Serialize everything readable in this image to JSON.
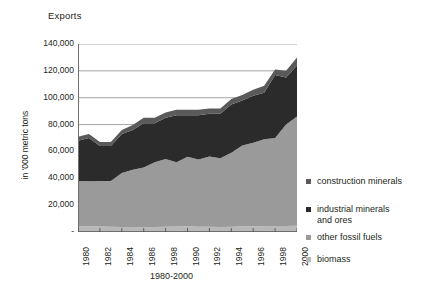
{
  "chart_data": {
    "type": "area",
    "stacked": true,
    "title": "Exports",
    "xlabel": "1980-2000",
    "ylabel": "in '000 metric tons",
    "ylim": [
      0,
      140000
    ],
    "grid": true,
    "legend_position": "right",
    "y_ticks": [
      "-",
      "20,000",
      "40,000",
      "60,000",
      "80,000",
      "100,000",
      "120,000",
      "140,000"
    ],
    "y_tick_values": [
      0,
      20000,
      40000,
      60000,
      80000,
      100000,
      120000,
      140000
    ],
    "x_tick_labels": [
      "1980",
      "1982",
      "1984",
      "1986",
      "1998",
      "1990",
      "1992",
      "1994",
      "1996",
      "1998",
      "2000"
    ],
    "x": [
      1980,
      1981,
      1982,
      1983,
      1984,
      1985,
      1986,
      1987,
      1988,
      1989,
      1990,
      1991,
      1992,
      1993,
      1994,
      1995,
      1996,
      1997,
      1998,
      1999,
      2000
    ],
    "series": [
      {
        "name": "biomass",
        "color": "#b8b8b8",
        "values": [
          4200,
          4300,
          4100,
          3900,
          3800,
          3700,
          3600,
          3700,
          4000,
          4100,
          4300,
          4000,
          3900,
          3800,
          3900,
          4300,
          4200,
          4300,
          4400,
          4500,
          4700
        ]
      },
      {
        "name": "other fossil fuels",
        "color": "#9a9a9a",
        "values": [
          33800,
          33500,
          33900,
          34100,
          40200,
          42700,
          44400,
          48300,
          50300,
          47900,
          51700,
          50000,
          52400,
          51200,
          55100,
          60100,
          62200,
          64700,
          65600,
          75500,
          81300
        ]
      },
      {
        "name": "industrial minerals and ores",
        "color": "#2b2b2b",
        "values": [
          30000,
          32200,
          26000,
          26000,
          29000,
          29500,
          33000,
          29000,
          30700,
          35000,
          31000,
          33000,
          31700,
          33000,
          36000,
          33600,
          35000,
          34700,
          47000,
          35000,
          38000
        ]
      },
      {
        "name": "construction minerals",
        "color": "#5a5a5a",
        "values": [
          3000,
          3000,
          3000,
          3000,
          3000,
          3800,
          4000,
          4000,
          4000,
          4000,
          4000,
          4000,
          4000,
          4000,
          4000,
          4000,
          4600,
          5300,
          4000,
          5000,
          6000
        ]
      }
    ],
    "legend": [
      {
        "label": "construction minerals",
        "color": "#5a5a5a"
      },
      {
        "label": "industrial minerals\nand ores",
        "color": "#2b2b2b"
      },
      {
        "label": "other fossil fuels",
        "color": "#9a9a9a"
      },
      {
        "label": "biomass",
        "color": "#b8b8b8"
      }
    ]
  }
}
